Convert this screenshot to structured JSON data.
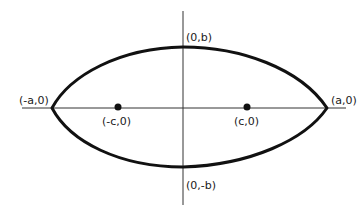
{
  "diagram": {
    "type": "ellipse-with-foci",
    "stroke_color": "#111111",
    "axis_color": "#333333",
    "labels": {
      "top_vertex": "(0,b)",
      "bottom_vertex": "(0,-b)",
      "left_vertex": "(-a,0)",
      "right_vertex": "(a,0)",
      "left_focus": "(-c,0)",
      "right_focus": "(c,0)"
    }
  }
}
